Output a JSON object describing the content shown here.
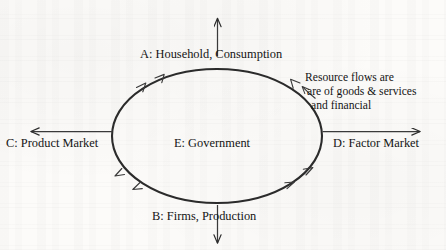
{
  "diagram": {
    "type": "circular-flow-diagram",
    "shape": "ellipse",
    "stroke_color": "#2b2b2b",
    "background_color": "#fcfbf9",
    "labels": {
      "top": "A: Household, Consumption",
      "bottom": "B: Firms, Production",
      "left": "C: Product Market",
      "right": "D: Factor Market",
      "center": "E: Government"
    },
    "annotation": {
      "line1": "Resource flows are",
      "line2": "are of goods & services",
      "line3": "and financial"
    },
    "arrows": [
      {
        "name": "top-outward-arrow",
        "direction": "up",
        "from": "ellipse-top",
        "to": "above-diagram"
      },
      {
        "name": "bottom-outward-arrow",
        "direction": "down",
        "from": "ellipse-bottom",
        "to": "below-diagram"
      },
      {
        "name": "left-outward-arrow",
        "direction": "left",
        "from": "ellipse-left",
        "to": "left-of-diagram"
      },
      {
        "name": "right-outward-arrow",
        "direction": "right",
        "from": "ellipse-right",
        "to": "right-of-diagram"
      },
      {
        "name": "annotation-pointer-arrow",
        "direction": "left",
        "from": "annotation-text",
        "to": "ellipse-upper-right"
      }
    ],
    "flow_arrowheads_on_ellipse": [
      {
        "name": "arrowhead-upper-left-outer",
        "quadrant": "upper-left",
        "points": "up-right"
      },
      {
        "name": "arrowhead-upper-left-inner",
        "quadrant": "upper-left",
        "points": "up-right"
      },
      {
        "name": "arrowhead-upper-right",
        "quadrant": "upper-right",
        "points": "up-left"
      },
      {
        "name": "arrowhead-lower-left-outer",
        "quadrant": "lower-left",
        "points": "up-left"
      },
      {
        "name": "arrowhead-lower-left-inner",
        "quadrant": "lower-left",
        "points": "up-left"
      },
      {
        "name": "arrowhead-lower-right-outer",
        "quadrant": "lower-right",
        "points": "up-right"
      },
      {
        "name": "arrowhead-lower-right-inner",
        "quadrant": "lower-right",
        "points": "up-right"
      }
    ]
  }
}
